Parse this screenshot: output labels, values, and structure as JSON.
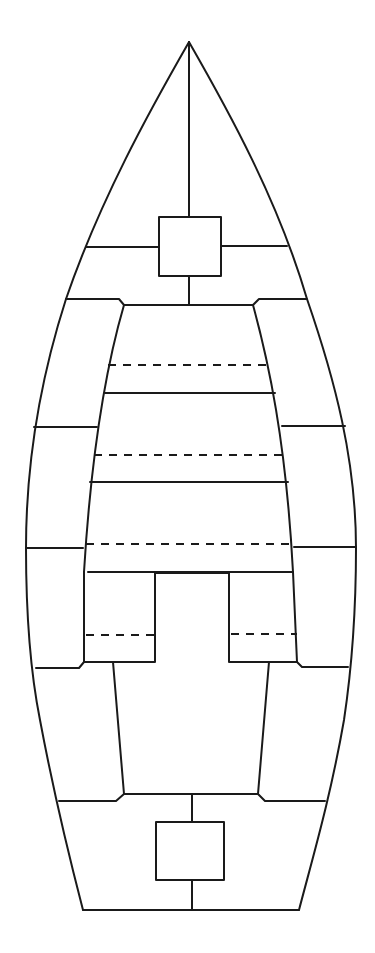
{
  "diagram": {
    "title": "",
    "stroke_color": "#1a1a1a",
    "background": "#ffffff",
    "elements": {
      "bow_hatch": {
        "x": 159,
        "y": 217,
        "w": 62,
        "h": 59
      },
      "stern_hatch": {
        "x": 156,
        "y": 822,
        "w": 68,
        "h": 58
      },
      "bench_dashed_rows": 3,
      "side_compartments_per_side": 4
    }
  }
}
